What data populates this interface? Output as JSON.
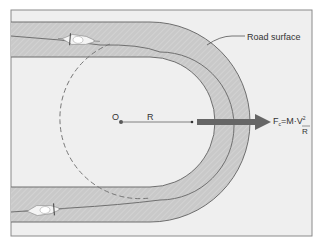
{
  "diagram": {
    "labels": {
      "road_surface": "Road surface",
      "center": "O",
      "radius": "R",
      "force_lhs": "F",
      "force_sub": "c",
      "force_eq": "=M·",
      "force_num": "V",
      "force_exp": "2",
      "force_den": "R"
    },
    "colors": {
      "background": "#ffffff",
      "panel": "#efefef",
      "road": "#c8c8c8",
      "road_edge": "#6e6e6e",
      "arrow": "#666666",
      "dashed_path": "#777777",
      "text": "#333333"
    },
    "elements": {
      "motorcycle_top": "motorcycle-icon",
      "motorcycle_bottom": "motorcycle-icon",
      "centrifugal_arrow": "arrow-right-icon"
    }
  }
}
